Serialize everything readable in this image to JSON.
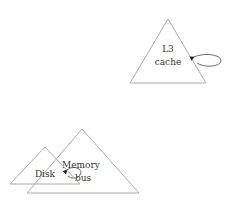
{
  "diagram": {
    "nodes": [
      {
        "id": "l3-cache",
        "lines": [
          "L3",
          "cache"
        ],
        "shape": "triangle"
      },
      {
        "id": "disk",
        "lines": [
          "Disk"
        ],
        "shape": "triangle"
      },
      {
        "id": "memory-bus",
        "lines": [
          "Memory",
          "bus"
        ],
        "shape": "triangle"
      }
    ],
    "edges": [
      {
        "from": "l3-cache",
        "to": "l3-cache",
        "type": "self-loop"
      },
      {
        "from": "memory-bus",
        "to": "memory-bus",
        "type": "self-loop"
      }
    ],
    "colors": {
      "stroke": "#aaaaaa",
      "text": "#333333",
      "arrow": "#222222"
    }
  }
}
